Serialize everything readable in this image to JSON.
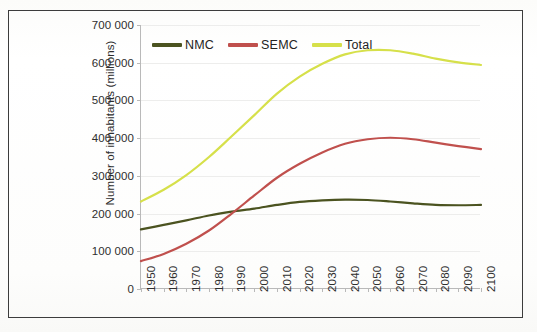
{
  "chart_data": {
    "type": "line",
    "title": "",
    "xlabel": "",
    "ylabel": "Number of inhabitants (millions)",
    "xlim": [
      1950,
      2100
    ],
    "ylim": [
      0,
      700000
    ],
    "ytick_step": 100000,
    "grid": true,
    "legend_position": "top-inside-left",
    "ytick_labels": [
      "700 000",
      "600 000",
      "500 000",
      "400 000",
      "300 000",
      "200 000",
      "100 000",
      "0"
    ],
    "ytick_values": [
      700000,
      600000,
      500000,
      400000,
      300000,
      200000,
      100000,
      0
    ],
    "categories": [
      1950,
      1960,
      1970,
      1980,
      1990,
      2000,
      2010,
      2020,
      2030,
      2040,
      2050,
      2060,
      2070,
      2080,
      2090,
      2100
    ],
    "xtick_labels": [
      "1950",
      "1960",
      "1970",
      "1980",
      "1990",
      "2000",
      "2010",
      "2020",
      "2030",
      "2040",
      "2050",
      "2060",
      "2070",
      "2080",
      "2090",
      "2100"
    ],
    "series": [
      {
        "name": "NMC",
        "color": "#4b5320",
        "values": [
          158000,
          170000,
          182000,
          195000,
          205000,
          213000,
          223000,
          231000,
          235000,
          237000,
          236000,
          232000,
          227000,
          223000,
          222000,
          223000
        ]
      },
      {
        "name": "SEMC",
        "color": "#c0504d",
        "values": [
          74000,
          93000,
          120000,
          155000,
          200000,
          248000,
          295000,
          332000,
          362000,
          385000,
          397000,
          401000,
          397000,
          388000,
          379000,
          371000
        ]
      },
      {
        "name": "Total",
        "color": "#d6e04a",
        "values": [
          232000,
          263000,
          302000,
          350000,
          405000,
          461000,
          518000,
          563000,
          597000,
          622000,
          633000,
          633000,
          624000,
          611000,
          601000,
          594000
        ]
      }
    ]
  },
  "legend": {
    "items": [
      {
        "label": "NMC",
        "color": "#4b5320"
      },
      {
        "label": "SEMC",
        "color": "#c0504d"
      },
      {
        "label": "Total",
        "color": "#d6e04a"
      }
    ]
  },
  "axes": {
    "y_title": "Number of inhabitants (millions)"
  },
  "colors": {
    "nmc": "#4b5320",
    "semc": "#c0504d",
    "total": "#d6e04a",
    "frame": "#3c3c3c",
    "axis": "#b9b9b9",
    "grid": "#ededec",
    "text": "#2e2e2e"
  }
}
